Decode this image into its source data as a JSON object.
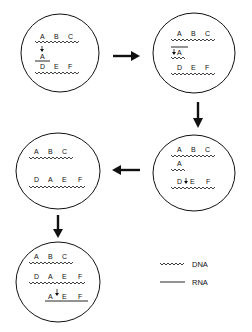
{
  "diagram": {
    "type": "process-flow",
    "flow_order": [
      "cell-1",
      "cell-2",
      "cell-3",
      "cell-4",
      "cell-5"
    ],
    "cells": [
      {
        "id": "cell-1",
        "dna_top": [
          "A",
          "B",
          "C"
        ],
        "rna_label": "A",
        "dna_bottom": [
          "D",
          "E",
          "F"
        ]
      },
      {
        "id": "cell-2",
        "dna_top": [
          "A",
          "B",
          "C"
        ],
        "new_dna_label": "A",
        "dna_bottom": [
          "D",
          "E",
          "F"
        ]
      },
      {
        "id": "cell-3",
        "dna_top": [
          "A",
          "B",
          "C"
        ],
        "new_dna_label": "A",
        "dna_bottom": [
          "D",
          "E",
          "F"
        ]
      },
      {
        "id": "cell-4",
        "dna_top": [
          "A",
          "B",
          "C"
        ],
        "dna_bottom": [
          "D",
          "A",
          "E",
          "F"
        ]
      },
      {
        "id": "cell-5",
        "dna_top": [
          "A",
          "B",
          "C"
        ],
        "dna_bottom": [
          "D",
          "A",
          "E",
          "F"
        ],
        "rna_bottom": [
          "A",
          "E",
          "F"
        ]
      }
    ],
    "legend": {
      "dna_label": "DNA",
      "rna_label": "RNA"
    },
    "colors": {
      "stroke": "#111111",
      "background": "#ffffff"
    }
  }
}
